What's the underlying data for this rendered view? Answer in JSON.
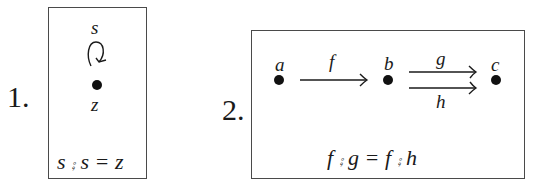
{
  "diagrams": [
    {
      "number": "1.",
      "objects": [
        {
          "label": "z"
        }
      ],
      "morphisms": [
        {
          "label": "s",
          "from": "z",
          "to": "z",
          "kind": "loop"
        }
      ],
      "equation": "s ⨾ s = z"
    },
    {
      "number": "2.",
      "objects": [
        {
          "label": "a"
        },
        {
          "label": "b"
        },
        {
          "label": "c"
        }
      ],
      "morphisms": [
        {
          "label": "f",
          "from": "a",
          "to": "b"
        },
        {
          "label": "g",
          "from": "b",
          "to": "c"
        },
        {
          "label": "h",
          "from": "b",
          "to": "c"
        }
      ],
      "equation": "f ⨾ g = f ⨾ h"
    }
  ]
}
